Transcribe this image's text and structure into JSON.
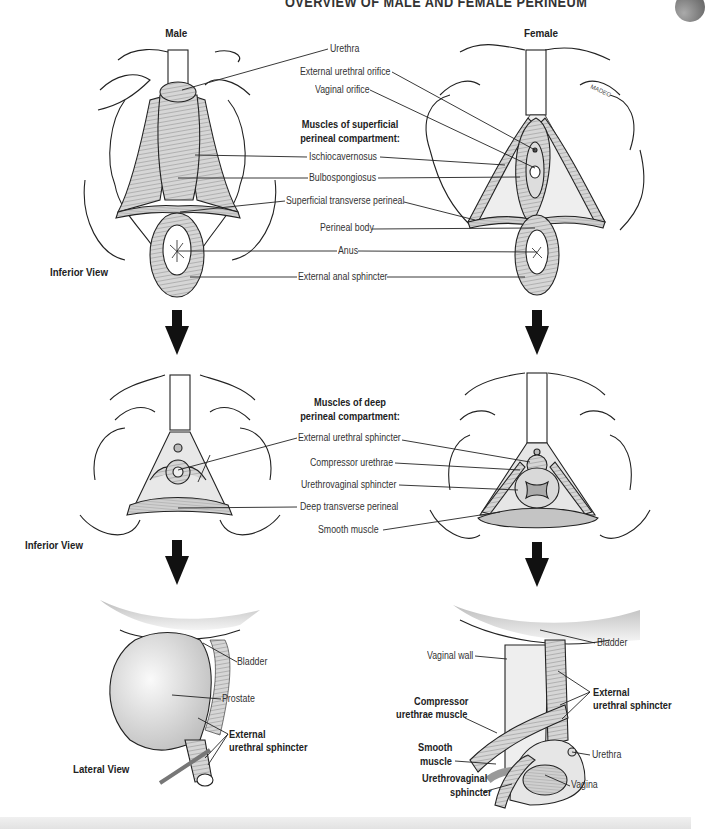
{
  "header": {
    "title": "OVERVIEW OF MALE AND FEMALE PERINEUM"
  },
  "columns": {
    "male": "Male",
    "female": "Female"
  },
  "section1": {
    "view_label": "Inferior View",
    "heading": "Muscles of superficial perineal compartment:",
    "heading_line1": "Muscles of superficial",
    "heading_line2": "perineal compartment:",
    "labels": {
      "urethra": "Urethra",
      "external_urethral_orifice": "External urethral orifice",
      "vaginal_orifice": "Vaginal orifice",
      "ischiocavernosus": "Ischiocavernosus",
      "bulbospongiosus": "Bulbospongiosus",
      "superficial_transverse_perineal": "Superficial transverse perineal",
      "perineal_body": "Perineal body",
      "anus": "Anus",
      "external_anal_sphincter": "External anal sphincter"
    },
    "signature": "MADEG"
  },
  "section2": {
    "view_label": "Inferior View",
    "heading_line1": "Muscles of deep",
    "heading_line2": "perineal compartment:",
    "labels": {
      "external_urethral_sphincter": "External urethral sphincter",
      "compressor_urethrae": "Compressor urethrae",
      "urethrovaginal_sphincter": "Urethrovaginal sphincter",
      "deep_transverse_perineal": "Deep transverse perineal",
      "smooth_muscle": "Smooth muscle"
    }
  },
  "section3": {
    "view_label": "Lateral View",
    "male_labels": {
      "bladder": "Bladder",
      "prostate": "Prostate",
      "ext_sphincter_line1": "External",
      "ext_sphincter_line2": "urethral sphincter"
    },
    "female_labels": {
      "bladder": "Bladder",
      "vaginal_wall": "Vaginal wall",
      "ext_sphincter_line1": "External",
      "ext_sphincter_line2": "urethral sphincter",
      "compressor_line1": "Compressor",
      "compressor_line2": "urethrae muscle",
      "smooth_line1": "Smooth",
      "smooth_line2": "muscle",
      "urethra": "Urethra",
      "urethrovaginal_line1": "Urethrovaginal",
      "urethrovaginal_line2": "sphincter",
      "vagina": "Vagina"
    }
  },
  "colors": {
    "line": "#222222",
    "muscle_fill": "#cfcfcf",
    "tissue_fill": "#ececec",
    "arrow": "#111111"
  },
  "icons": {
    "flow_arrow": "down-arrow-icon"
  }
}
